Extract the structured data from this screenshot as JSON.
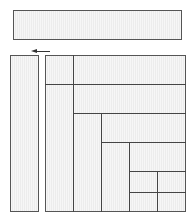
{
  "diagram": {
    "type": "recursive-rectangle-subdivision",
    "elements": {
      "top_bar": {
        "label": ""
      },
      "arrow": {
        "direction": "left"
      },
      "left_column": {
        "label": ""
      },
      "grid": {
        "label": ""
      }
    },
    "colors": {
      "stroke": "#444444",
      "fill_light": "#f6f6f6",
      "fill_stripe": "#ececec"
    }
  }
}
